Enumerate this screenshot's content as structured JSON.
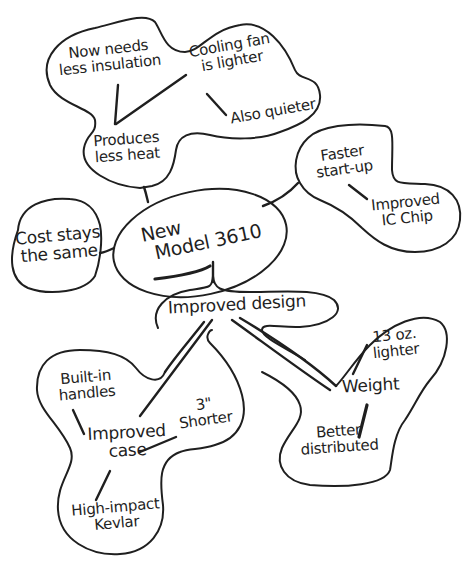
{
  "diagram": {
    "type": "mind-map",
    "style": "hand-drawn",
    "colors": {
      "ink": "#1f1f1f",
      "background": "#ffffff"
    },
    "central": {
      "line1": "New",
      "line2": "Model 3610"
    },
    "branches": {
      "heat": {
        "produces_less_heat": {
          "line1": "Produces",
          "line2": "less heat"
        },
        "less_insulation": {
          "line1": "Now needs",
          "line2": "less insulation"
        },
        "cooling_fan": {
          "line1": "Cooling fan",
          "line2": "is lighter"
        },
        "also_quieter": {
          "line1": "Also quieter"
        }
      },
      "startup": {
        "faster_startup": {
          "line1": "Faster",
          "line2": "start-up"
        },
        "improved_chip": {
          "line1": "Improved",
          "line2": "IC Chip"
        }
      },
      "cost": {
        "cost_same": {
          "line1": "Cost stays",
          "line2": "the same"
        }
      },
      "design": {
        "improved_design": {
          "line1": "Improved design"
        },
        "improved_case": {
          "line1": "Improved",
          "line2": "case"
        },
        "built_in_handles": {
          "line1": "Built-in",
          "line2": "handles"
        },
        "shorter": {
          "line1": "3\"",
          "line2": "Shorter"
        },
        "kevlar": {
          "line1": "High-impact",
          "line2": "Kevlar"
        },
        "weight": {
          "line1": "Weight"
        },
        "lighter": {
          "line1": "13 oz.",
          "line2": "lighter"
        },
        "better_distributed": {
          "line1": "Better",
          "line2": "distributed"
        }
      }
    }
  }
}
